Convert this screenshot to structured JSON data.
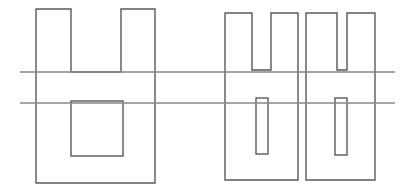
{
  "canvas": {
    "width": 410,
    "height": 193,
    "background_color": "#ffffff"
  },
  "style": {
    "shape_stroke_color": "#595959",
    "shape_stroke_width": 1.4,
    "line_stroke_color": "#878787",
    "line_stroke_width": 1.4,
    "fill": "none"
  },
  "drawing": {
    "type": "line-drawing",
    "description": "Three outlined comb-like polygon shapes crossed by two long horizontal lines",
    "shapes": [
      {
        "name": "comb-shape-left",
        "kind": "polygon",
        "points": "36,9 71,9 71,72 121,72 121,9 155,9 155,183 36,183",
        "inner_rects": [
          {
            "name": "inner-rect-left-lower",
            "x": 71,
            "y": 101,
            "width": 52,
            "height": 55
          }
        ]
      },
      {
        "name": "comb-shape-middle",
        "kind": "polygon",
        "points": "225,13 252,13 252,70 271,70 271,13 298,13 298,180 225,180",
        "inner_rects": [
          {
            "name": "inner-rect-middle-lower",
            "x": 256,
            "y": 98,
            "width": 12,
            "height": 56
          }
        ]
      },
      {
        "name": "comb-shape-right",
        "kind": "polygon",
        "points": "306,13 337,13 337,70 347,70 347,13 375,13 375,180 306,180",
        "inner_rects": [
          {
            "name": "inner-rect-right-lower",
            "x": 335,
            "y": 98,
            "width": 12,
            "height": 57
          }
        ]
      }
    ],
    "horizontal_lines": [
      {
        "name": "horizontal-line-upper",
        "x1": 20,
        "y1": 72,
        "x2": 395,
        "y2": 72
      },
      {
        "name": "horizontal-line-lower",
        "x1": 20,
        "y1": 103,
        "x2": 395,
        "y2": 103
      }
    ]
  }
}
